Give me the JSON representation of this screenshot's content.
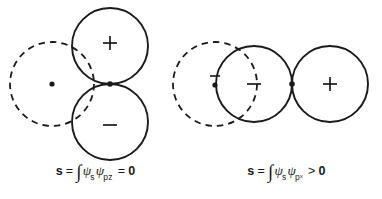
{
  "figure": {
    "title": "",
    "background_color": "#ffffff",
    "stroke_color": "#1a1a1a",
    "panels": [
      {
        "id": "left",
        "name": "s-pz-overlap",
        "description": "s orbital overlapping perpendicular to a p-z orbital; net overlap cancels",
        "s_orbital": {
          "style": "dashed",
          "nucleus_marker": "dot",
          "sign_label": ""
        },
        "p_orbital": {
          "style": "solid",
          "orientation": "vertical",
          "lobes": [
            {
              "label": "+",
              "position": "top"
            },
            {
              "label": "−",
              "position": "bottom"
            }
          ],
          "nucleus_marker": "dot"
        },
        "caption": {
          "symbol": "s",
          "equals": "=",
          "integral": "∫",
          "psi_a": "ψ",
          "psi_a_sub": "s",
          "psi_b": "ψ",
          "psi_b_sub": "pᴢ",
          "relation": "=",
          "value": "0",
          "plain": "s = ∫ ψsψpz = 0"
        }
      },
      {
        "id": "right",
        "name": "s-px-overlap",
        "description": "s orbital overlapping head-on with a p-x orbital; net overlap is positive",
        "s_orbital": {
          "style": "dashed",
          "nucleus_marker": "dot",
          "sign_label": "−"
        },
        "p_orbital": {
          "style": "solid",
          "orientation": "horizontal",
          "lobes": [
            {
              "label": "−",
              "position": "left"
            },
            {
              "label": "+",
              "position": "right"
            }
          ],
          "nucleus_marker": "dot"
        },
        "caption": {
          "symbol": "s",
          "equals": "=",
          "integral": "∫",
          "psi_a": "ψ",
          "psi_a_sub": "s",
          "psi_b": "ψ",
          "psi_b_sub": "pˣ",
          "relation": ">",
          "value": "0",
          "plain": "s = ∫ ψsψpx > 0"
        }
      }
    ]
  }
}
